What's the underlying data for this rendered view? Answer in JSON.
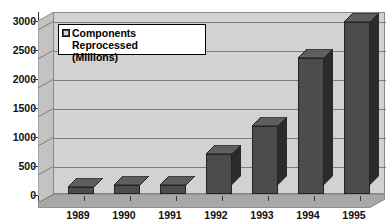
{
  "chart_data": {
    "type": "bar",
    "title": "",
    "xlabel": "",
    "ylabel": "",
    "categories": [
      "1989",
      "1990",
      "1991",
      "1992",
      "1993",
      "1994",
      "1995"
    ],
    "values": [
      120,
      150,
      150,
      700,
      1180,
      2350,
      2980
    ],
    "series": [
      {
        "name": "Components Reprocessed (Millions)",
        "values": [
          120,
          150,
          150,
          700,
          1180,
          2350,
          2980
        ]
      }
    ],
    "ylim": [
      0,
      3000
    ],
    "ytick_labels": [
      "3000",
      "2500",
      "2000",
      "1500",
      "1000",
      "500",
      "0"
    ],
    "ytick_values": [
      3000,
      2500,
      2000,
      1500,
      1000,
      500,
      0
    ],
    "grid": true,
    "legend_position": "upper-left-inside",
    "bar_color": "#4c4c4c",
    "bar_side_color": "#2b2b2b",
    "plot_background": "#d2d2d2"
  },
  "legend": {
    "label": "Components Reprocessed\n(Millions)",
    "swatch_icon": "legend-swatch-icon"
  },
  "axes": {
    "y_labels": [
      "3000",
      "2500",
      "2000",
      "1500",
      "1000",
      "500",
      "0"
    ],
    "x_labels": [
      "1989",
      "1990",
      "1991",
      "1992",
      "1993",
      "1994",
      "1995"
    ]
  },
  "clipped_title": ""
}
